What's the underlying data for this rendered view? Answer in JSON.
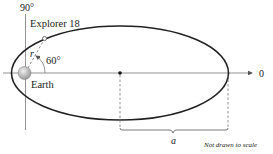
{
  "diagram": {
    "labels": {
      "angle_top": "90°",
      "satellite": "Explorer 18",
      "radius": "r",
      "angle": "60°",
      "planet": "Earth",
      "angle_zero": "0",
      "semi_major_axis": "a",
      "note": "Not drawn to scale"
    },
    "colors": {
      "line": "#222222",
      "axis": "#777777",
      "earth": "#b8b8b8"
    }
  }
}
